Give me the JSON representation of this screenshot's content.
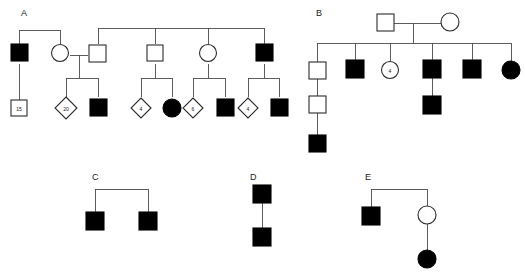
{
  "page": {
    "background": "#ffffff",
    "line_color": "#4a4a4a",
    "symbol_stroke": "#2b2b2b",
    "affected_fill": "#000000",
    "unaffected_fill": "#ffffff",
    "width": 525,
    "height": 273
  },
  "families": {
    "a": {
      "label": "A",
      "members": {
        "gen1_male_affected": "",
        "gen1_female_unaffected": "",
        "spouse_male_unaffected": "",
        "sib2_male_unaffected": "",
        "sib3_female_unaffected": "",
        "sib4_male_affected": "",
        "child_square_15": "15",
        "child_diamond_20": "20",
        "child_male_affected_1": "",
        "child_diamond_4a": "4",
        "child_female_affected": "",
        "child_diamond_6": "6",
        "child_male_affected_2": "",
        "child_diamond_4b": "4",
        "child_male_affected_3": ""
      }
    },
    "b": {
      "label": "B",
      "members": {
        "father_unaffected": "",
        "mother_unaffected": "",
        "child1_male_unaffected": "",
        "grandchild_male_unaffected": "",
        "greatgrandchild_male_affected": "",
        "child2_male_affected": "",
        "child3_female_circle_4": "4",
        "child4_male_affected": "",
        "child4_son_male_affected": "",
        "child5_male_affected": "",
        "child6_female_affected": ""
      }
    },
    "c": {
      "label": "C",
      "members": {
        "sib1_male_affected": "",
        "sib2_male_affected": ""
      }
    },
    "d": {
      "label": "D",
      "members": {
        "parent_male_affected": "",
        "child_male_affected": ""
      }
    },
    "e": {
      "label": "E",
      "members": {
        "sib1_male_affected": "",
        "sib2_female_unaffected": "",
        "daughter_female_affected": ""
      }
    }
  }
}
